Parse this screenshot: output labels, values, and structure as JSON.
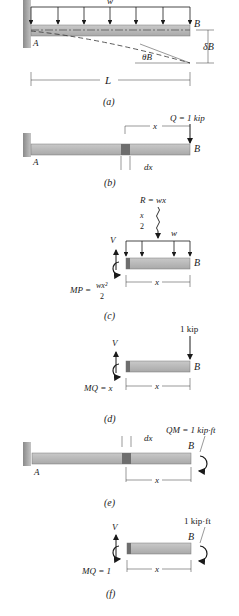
{
  "figure": {
    "panels": [
      {
        "id": "a",
        "caption": "(a)",
        "labels": {
          "load": "w",
          "fixed_end": "A",
          "free_end": "B",
          "deflection": "δB",
          "slope": "θB",
          "length": "L"
        }
      },
      {
        "id": "b",
        "caption": "(b)",
        "labels": {
          "load": "Q = 1 kip",
          "fixed_end": "A",
          "free_end": "B",
          "distance": "x",
          "element": "dx"
        }
      },
      {
        "id": "c",
        "caption": "(c)",
        "labels": {
          "resultant": "R = wx",
          "half": "x",
          "half_den": "2",
          "load": "w",
          "shear": "V",
          "moment_lhs": "MP =",
          "moment_num": "wx²",
          "moment_den": "2",
          "free_end": "B",
          "distance": "x"
        }
      },
      {
        "id": "d",
        "caption": "(d)",
        "labels": {
          "load": "1 kip",
          "shear": "V",
          "moment": "MQ = x",
          "free_end": "B",
          "distance": "x"
        }
      },
      {
        "id": "e",
        "caption": "(e)",
        "labels": {
          "couple": "QM = 1 kip·ft",
          "element": "dx",
          "fixed_end": "A",
          "free_end": "B",
          "distance": "x"
        }
      },
      {
        "id": "f",
        "caption": "(f)",
        "labels": {
          "couple": "1 kip·ft",
          "shear": "V",
          "moment": "MQ = 1",
          "free_end": "B",
          "distance": "x"
        }
      }
    ]
  },
  "colors": {
    "beam": "#b8b8b8",
    "beam_dark": "#7a7a7a",
    "wall": "#a0a0a0",
    "ink": "#1a1a1a"
  }
}
